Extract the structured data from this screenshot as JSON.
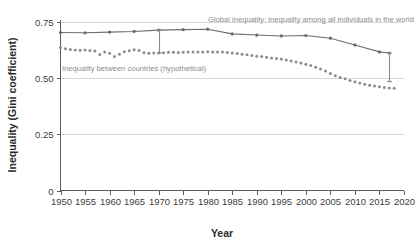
{
  "chart_data": {
    "type": "line",
    "title": "",
    "xlabel": "Year",
    "ylabel": "Inequality (Gini coefficient)",
    "xlim": [
      1950,
      2020
    ],
    "ylim": [
      0,
      0.75
    ],
    "xticks": [
      "1950",
      "1955",
      "1960",
      "1965",
      "1970",
      "1975",
      "1980",
      "1985",
      "1990",
      "1995",
      "2000",
      "2005",
      "2010",
      "2015",
      "2020"
    ],
    "yticks": [
      "0",
      "0.25",
      "0.50",
      "0.75"
    ],
    "grid": "horizontal",
    "legend_position": "inline-annotation",
    "series": [
      {
        "name": "Global inequality: inequality among all individuals in the world",
        "style": "solid-with-markers",
        "color": "#6e6e6e",
        "x": [
          1950,
          1955,
          1960,
          1965,
          1970,
          1975,
          1980,
          1985,
          1990,
          1995,
          2000,
          2005,
          2010,
          2015,
          2017
        ],
        "values": [
          0.703,
          0.702,
          0.705,
          0.708,
          0.714,
          0.716,
          0.718,
          0.697,
          0.692,
          0.688,
          0.69,
          0.678,
          0.648,
          0.617,
          0.612
        ]
      },
      {
        "name": "Inequality between countries (hypothetical)",
        "style": "dotted",
        "color": "#8d8d8d",
        "x": [
          1950,
          1951,
          1952,
          1953,
          1954,
          1955,
          1956,
          1957,
          1958,
          1959,
          1960,
          1961,
          1962,
          1963,
          1964,
          1965,
          1966,
          1967,
          1968,
          1969,
          1970,
          1971,
          1972,
          1973,
          1974,
          1975,
          1976,
          1977,
          1978,
          1979,
          1980,
          1981,
          1982,
          1983,
          1984,
          1985,
          1986,
          1987,
          1988,
          1989,
          1990,
          1991,
          1992,
          1993,
          1994,
          1995,
          1996,
          1997,
          1998,
          1999,
          2000,
          2001,
          2002,
          2003,
          2004,
          2005,
          2006,
          2007,
          2008,
          2009,
          2010,
          2011,
          2012,
          2013,
          2014,
          2015,
          2016,
          2017,
          2018
        ],
        "values": [
          0.637,
          0.631,
          0.628,
          0.625,
          0.624,
          0.625,
          0.623,
          0.621,
          0.605,
          0.616,
          0.611,
          0.596,
          0.607,
          0.618,
          0.622,
          0.626,
          0.623,
          0.613,
          0.611,
          0.612,
          0.612,
          0.613,
          0.615,
          0.615,
          0.614,
          0.615,
          0.616,
          0.617,
          0.616,
          0.617,
          0.618,
          0.617,
          0.617,
          0.616,
          0.614,
          0.612,
          0.61,
          0.607,
          0.604,
          0.601,
          0.598,
          0.596,
          0.593,
          0.59,
          0.588,
          0.585,
          0.581,
          0.576,
          0.572,
          0.567,
          0.562,
          0.556,
          0.549,
          0.541,
          0.532,
          0.521,
          0.511,
          0.503,
          0.497,
          0.49,
          0.484,
          0.478,
          0.473,
          0.469,
          0.465,
          0.462,
          0.459,
          0.456,
          0.455
        ]
      }
    ],
    "connectors": [
      {
        "name": "gap-marker-1970",
        "x": 1970,
        "y_top": 0.714,
        "y_bottom": 0.612
      },
      {
        "name": "gap-marker-2017",
        "x": 2017,
        "y_top": 0.612,
        "y_bottom": 0.485
      }
    ],
    "annotations": [
      {
        "name": "global-inequality-label",
        "text": "Global inequality: inequality among all individuals in the world",
        "x_px": 208,
        "y_px": 22
      },
      {
        "name": "between-countries-label",
        "text": "Inequality between countries (hypothetical)",
        "x_px": 62,
        "y_px": 71
      }
    ]
  }
}
